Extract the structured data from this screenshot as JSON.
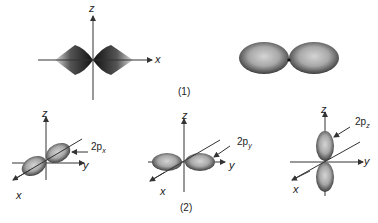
{
  "figure": {
    "part1": {
      "caption": "(1)",
      "angular_plot": {
        "axis_z": "z",
        "axis_x": "x"
      },
      "lobes_view": {
        "nucleus": "dot"
      }
    },
    "part2": {
      "caption": "(2)",
      "px": {
        "axis_z": "z",
        "axis_y": "y",
        "axis_x": "x",
        "label_main": "2p",
        "label_sub": "x"
      },
      "py": {
        "axis_z": "z",
        "axis_y": "y",
        "axis_x": "x",
        "label_main": "2p",
        "label_sub": "y"
      },
      "pz": {
        "axis_z": "z",
        "axis_y": "y",
        "axis_x": "x",
        "label_main": "2p",
        "label_sub": "z"
      }
    },
    "colors": {
      "axis": "#333333",
      "lobe_dark": "#3a3a3a",
      "lobe_light": "#cfcfcf",
      "background": "#ffffff"
    }
  }
}
